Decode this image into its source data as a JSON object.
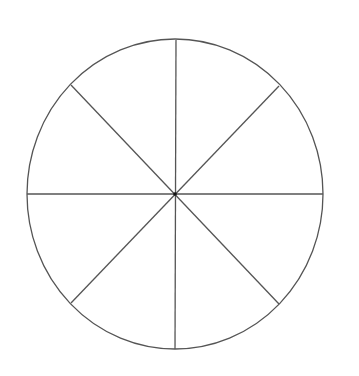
{
  "diagram": {
    "type": "divided-circle",
    "segments": 8,
    "stroke_color": "#555555",
    "fill_color": "#ffffff",
    "center": {
      "x": 175,
      "y": 194
    },
    "radius_x": 148,
    "radius_y": 155
  }
}
